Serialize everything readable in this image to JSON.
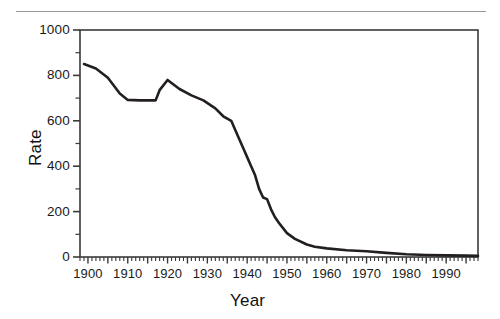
{
  "figure": {
    "has_top_rule": true,
    "line_color": "#231f20",
    "axis_color": "#3a3a3a",
    "background": "#ffffff"
  },
  "chart_data": {
    "type": "line",
    "title": "",
    "xlabel": "Year",
    "ylabel": "Rate",
    "xlim": [
      1898,
      1998
    ],
    "ylim": [
      0,
      1000
    ],
    "grid": false,
    "legend": null,
    "x_major_ticks": [
      1900,
      1910,
      1920,
      1930,
      1940,
      1950,
      1960,
      1970,
      1980,
      1990
    ],
    "x_tick_labels": [
      "1900",
      "1910",
      "1920",
      "1930",
      "1940",
      "1950",
      "1960",
      "1970",
      "1980",
      "1990"
    ],
    "x_minor_tick_interval": 1,
    "y_major_ticks": [
      0,
      200,
      400,
      600,
      800,
      1000
    ],
    "y_tick_labels": [
      "0",
      "200",
      "400",
      "600",
      "800",
      "1000"
    ],
    "y_minor_tick_interval": 100,
    "series": [
      {
        "name": "Rate",
        "x": [
          1899,
          1902,
          1905,
          1908,
          1910,
          1913,
          1917,
          1918,
          1920,
          1923,
          1926,
          1929,
          1932,
          1934,
          1936,
          1938,
          1939,
          1940,
          1941,
          1942,
          1943,
          1944,
          1945,
          1946,
          1947,
          1948,
          1950,
          1952,
          1955,
          1957,
          1960,
          1965,
          1970,
          1975,
          1980,
          1985,
          1990,
          1995,
          1998
        ],
        "y": [
          850,
          830,
          790,
          720,
          692,
          690,
          690,
          735,
          780,
          740,
          712,
          690,
          655,
          620,
          600,
          520,
          480,
          440,
          400,
          360,
          300,
          262,
          255,
          210,
          175,
          150,
          105,
          80,
          55,
          45,
          38,
          30,
          25,
          18,
          12,
          9,
          7,
          6,
          5
        ]
      }
    ]
  },
  "axes": {
    "y_title": "Rate",
    "x_title": "Year"
  }
}
